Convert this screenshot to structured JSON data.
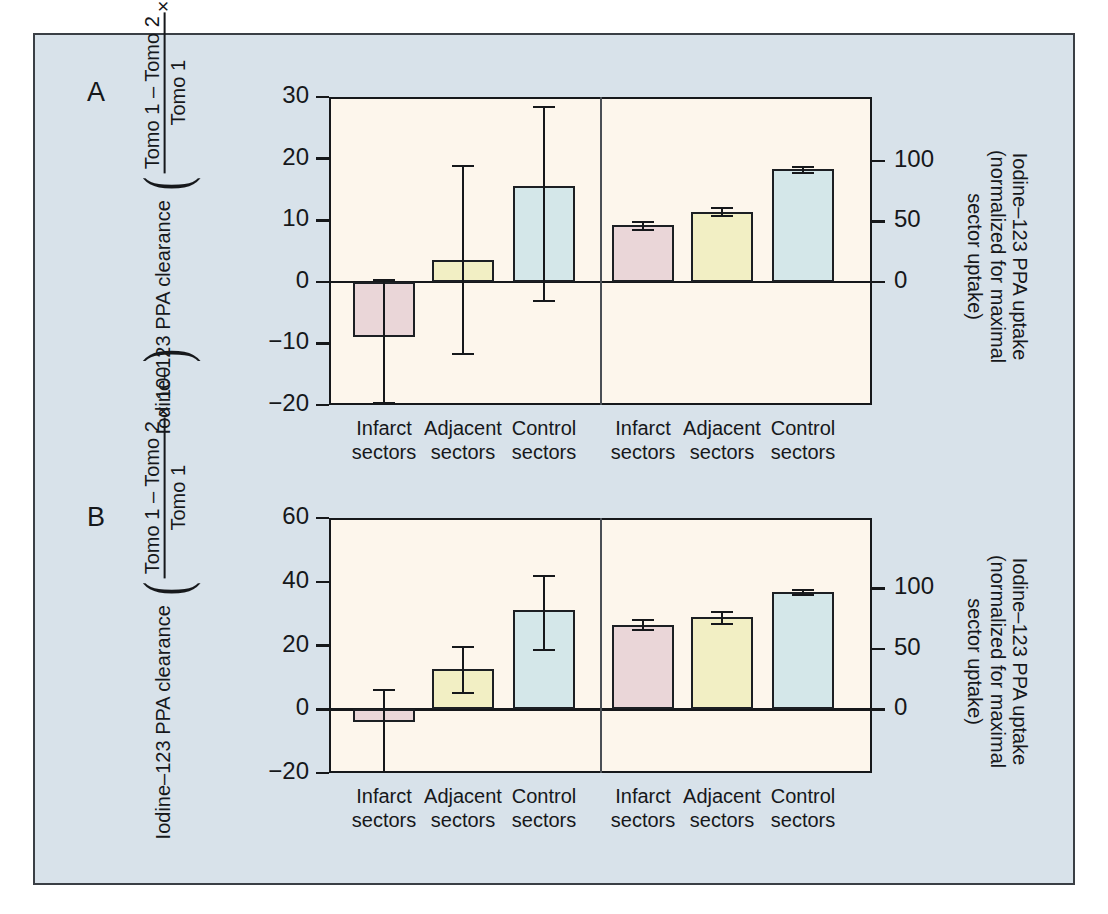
{
  "figure": {
    "background_color": "#d8e2ea",
    "plot_background_color": "#fdf6ec",
    "border_color": "#16181b"
  },
  "panels": [
    {
      "letter": "A",
      "left_axis_title": {
        "line1": "Iodine–123 PPA clearance",
        "numerator": "Tomo 1 – Tomo 2",
        "denominator": "Tomo 1",
        "multiplier": "× 100"
      },
      "right_axis_title": {
        "line1": "Iodine–123 PPA uptake",
        "line2": "(normalized for maximal",
        "line3": "sector uptake)"
      },
      "left_ticks": [
        "30",
        "20",
        "10",
        "0",
        "−10",
        "−20"
      ],
      "right_ticks": [
        "100",
        "50",
        "0"
      ],
      "categories": [
        "Infarct sectors",
        "Adjacent sectors",
        "Control sectors"
      ],
      "cat_line1": [
        "Infarct",
        "Adjacent",
        "Control"
      ],
      "cat_line2": [
        "sectors",
        "sectors",
        "sectors"
      ]
    },
    {
      "letter": "B",
      "left_axis_title": {
        "line1": "Iodine–123 PPA clearance",
        "numerator": "Tomo 1 – Tomo 2",
        "denominator": "Tomo 1",
        "multiplier": "× 100"
      },
      "right_axis_title": {
        "line1": "Iodine–123 PPA uptake",
        "line2": "(normalized for maximal",
        "line3": "sector uptake)"
      },
      "left_ticks": [
        "60",
        "40",
        "20",
        "0",
        "−20"
      ],
      "right_ticks": [
        "100",
        "50",
        "0"
      ],
      "categories": [
        "Infarct sectors",
        "Adjacent sectors",
        "Control sectors"
      ],
      "cat_line1": [
        "Infarct",
        "Adjacent",
        "Control"
      ],
      "cat_line2": [
        "sectors",
        "sectors",
        "sectors"
      ]
    }
  ],
  "colors": {
    "infarct": "#ead6d8",
    "adjacent": "#f2efc4",
    "control": "#d4e7e9",
    "outline": "#1c1f23"
  },
  "chart_data": [
    {
      "type": "bar",
      "panel": "A",
      "title": "Panel A",
      "xlabel": "",
      "ylabel_left": "Iodine-123 PPA clearance ((Tomo 1 - Tomo 2)/Tomo 1 x 100)",
      "ylabel_right": "Iodine-123 PPA uptake (normalized for maximal sector uptake)",
      "ylim_left": [
        -20,
        30
      ],
      "ylim_right": [
        0,
        100
      ],
      "left_ticks": [
        30,
        20,
        10,
        0,
        -10,
        -20
      ],
      "right_ticks": [
        100,
        50,
        0
      ],
      "grid": false,
      "legend": "none",
      "groups": [
        {
          "name": "clearance",
          "axis": "left",
          "categories": [
            "Infarct sectors",
            "Adjacent sectors",
            "Control sectors"
          ],
          "values": [
            -9.0,
            3.5,
            15.5
          ],
          "err_low": [
            -19.5,
            -11.5,
            -3.0
          ],
          "err_high": [
            0.5,
            19.0,
            28.5
          ],
          "colors": [
            "#ead6d8",
            "#f2efc4",
            "#d4e7e9"
          ]
        },
        {
          "name": "uptake",
          "axis": "right",
          "categories": [
            "Infarct sectors",
            "Adjacent sectors",
            "Control sectors"
          ],
          "values": [
            47,
            58,
            93
          ],
          "err_low": [
            44,
            55,
            91
          ],
          "err_high": [
            50,
            62,
            96
          ],
          "colors": [
            "#ead6d8",
            "#f2efc4",
            "#d4e7e9"
          ]
        }
      ]
    },
    {
      "type": "bar",
      "panel": "B",
      "title": "Panel B",
      "xlabel": "",
      "ylabel_left": "Iodine-123 PPA clearance ((Tomo 1 - Tomo 2)/Tomo 1 x 100)",
      "ylabel_right": "Iodine-123 PPA uptake (normalized for maximal sector uptake)",
      "ylim_left": [
        -20,
        60
      ],
      "ylim_right": [
        0,
        100
      ],
      "left_ticks": [
        60,
        40,
        20,
        0,
        -20
      ],
      "right_ticks": [
        100,
        50,
        0
      ],
      "grid": false,
      "legend": "none",
      "groups": [
        {
          "name": "clearance",
          "axis": "left",
          "categories": [
            "Infarct sectors",
            "Adjacent sectors",
            "Control sectors"
          ],
          "values": [
            -4.0,
            12.5,
            31.0
          ],
          "err_low": [
            -19.5,
            5.5,
            19.0
          ],
          "err_high": [
            6.5,
            20.0,
            42.0
          ],
          "colors": [
            "#ead6d8",
            "#f2efc4",
            "#d4e7e9"
          ]
        },
        {
          "name": "uptake",
          "axis": "right",
          "categories": [
            "Infarct sectors",
            "Adjacent sectors",
            "Control sectors"
          ],
          "values": [
            70,
            76,
            97
          ],
          "err_low": [
            66,
            71,
            95
          ],
          "err_high": [
            75,
            81,
            99
          ],
          "colors": [
            "#ead6d8",
            "#f2efc4",
            "#d4e7e9"
          ]
        }
      ]
    }
  ]
}
